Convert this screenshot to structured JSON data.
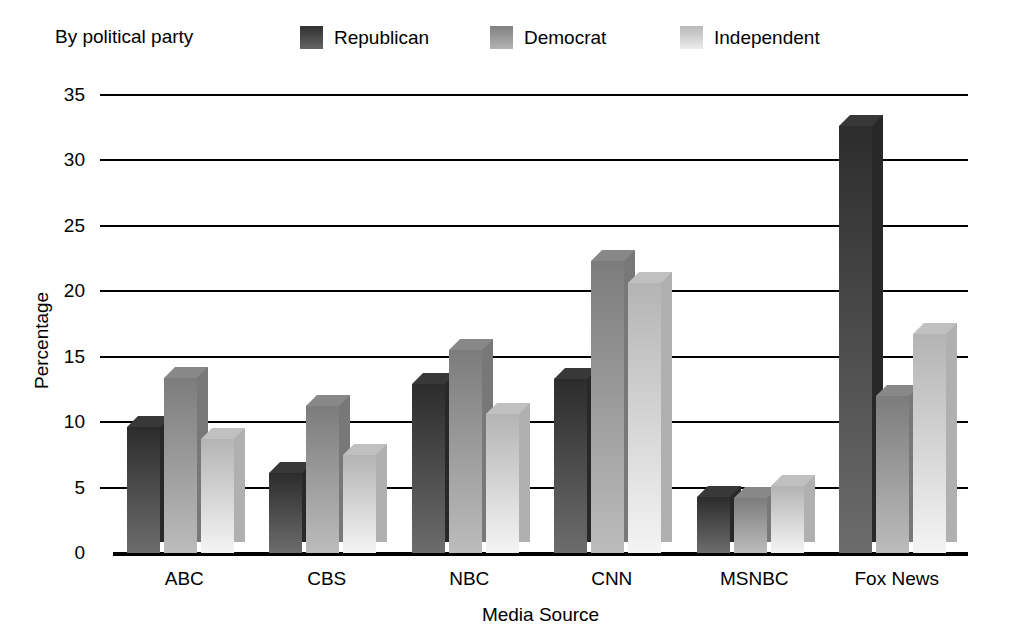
{
  "legend": {
    "title": "By political party",
    "entries": [
      {
        "label": "Republican",
        "color": "#4a4a4a"
      },
      {
        "label": "Democrat",
        "color": "#9a9a9a"
      },
      {
        "label": "Independent",
        "color": "#d2d2d2"
      }
    ]
  },
  "axes": {
    "ylabel": "Percentage",
    "xlabel": "Media Source",
    "yticks": [
      "0",
      "5",
      "10",
      "15",
      "20",
      "25",
      "30",
      "35"
    ]
  },
  "chart_data": {
    "type": "bar",
    "title": "",
    "subtitle": "By political party",
    "xlabel": "Media Source",
    "ylabel": "Percentage",
    "categories": [
      "ABC",
      "CBS",
      "NBC",
      "CNN",
      "MSNBC",
      "Fox News"
    ],
    "series": [
      {
        "name": "Republican",
        "color": "#4a4a4a",
        "values": [
          9.6,
          6.1,
          12.9,
          13.3,
          4.3,
          32.6
        ]
      },
      {
        "name": "Democrat",
        "color": "#9a9a9a",
        "values": [
          13.4,
          11.2,
          15.5,
          22.3,
          4.2,
          12.0
        ]
      },
      {
        "name": "Independent",
        "color": "#d2d2d2",
        "values": [
          8.7,
          7.5,
          10.6,
          20.6,
          5.1,
          16.7
        ]
      }
    ],
    "ylim": [
      0,
      35
    ],
    "ytick_step": 5,
    "grid": true,
    "legend_position": "top"
  }
}
